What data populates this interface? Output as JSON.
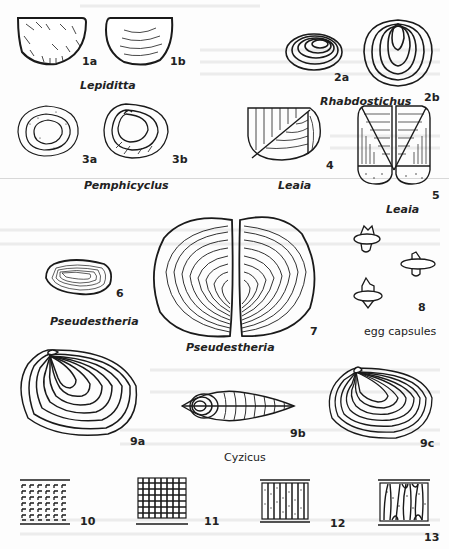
{
  "plate": {
    "bleed_through_header": "CRUSTACEANS AND INSECTS",
    "ink_color": "#1a1a1a",
    "paper_color": "#fdfdfd"
  },
  "figures": {
    "f1a": {
      "number": "1a"
    },
    "f1b": {
      "number": "1b"
    },
    "f2a": {
      "number": "2a"
    },
    "f2b": {
      "number": "2b"
    },
    "f3a": {
      "number": "3a"
    },
    "f3b": {
      "number": "3b"
    },
    "f4": {
      "number": "4"
    },
    "f5": {
      "number": "5"
    },
    "f6": {
      "number": "6"
    },
    "f7": {
      "number": "7"
    },
    "f8": {
      "number": "8"
    },
    "f9a": {
      "number": "9a"
    },
    "f9b": {
      "number": "9b"
    },
    "f9c": {
      "number": "9c"
    },
    "f10": {
      "number": "10"
    },
    "f11": {
      "number": "11"
    },
    "f12": {
      "number": "12"
    },
    "f13": {
      "number": "13"
    }
  },
  "captions": {
    "lepiditta": "Lepiditta",
    "rhabdostichus": "Rhabdostichus",
    "pemphicyclus": "Pemphicyclus",
    "leaia_4": "Leaia",
    "leaia_5": "Leaia",
    "pseudestheria_6": "Pseudestheria",
    "pseudestheria_7": "Pseudestheria",
    "egg_capsules": "egg capsules",
    "cyzicus": "Cyzicus"
  }
}
